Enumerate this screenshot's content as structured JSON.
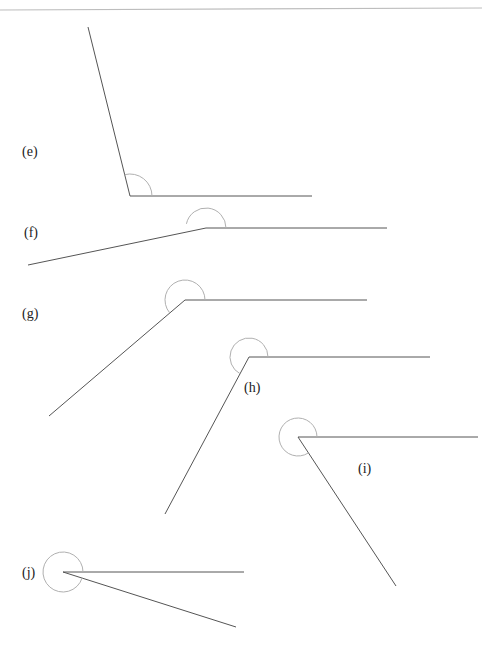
{
  "figure": {
    "type": "angle-diagrams",
    "panels": [
      {
        "label": "(e)",
        "label_pos": [
          22,
          152
        ],
        "vertex": [
          130,
          196
        ],
        "ray1_end": [
          88,
          27
        ],
        "ray2_end": [
          312,
          196
        ],
        "arc": {
          "r": 22,
          "start_deg": 0,
          "end_deg": 104
        }
      },
      {
        "label": "(f)",
        "label_pos": [
          24,
          224
        ],
        "vertex": [
          206,
          228
        ],
        "ray1_end": [
          28,
          265
        ],
        "ray2_end": [
          387,
          228
        ],
        "arc": {
          "r": 20,
          "start_deg": 0,
          "end_deg": 168
        }
      },
      {
        "label": "(g)",
        "label_pos": [
          22,
          305
        ],
        "vertex": [
          185,
          300
        ],
        "ray1_end": [
          49,
          416
        ],
        "ray2_end": [
          367,
          300
        ],
        "arc": {
          "r": 20,
          "start_deg": 0,
          "end_deg": 220
        }
      },
      {
        "label": "(h)",
        "label_pos": [
          244,
          378
        ],
        "vertex": [
          249,
          357
        ],
        "ray1_end": [
          165,
          514
        ],
        "ray2_end": [
          430,
          357
        ],
        "arc": {
          "r": 19,
          "start_deg": 0,
          "end_deg": 242
        }
      },
      {
        "label": "(i)",
        "label_pos": [
          358,
          460
        ],
        "vertex": [
          298,
          437
        ],
        "ray1_end": [
          396,
          586
        ],
        "ray2_end": [
          478,
          437
        ],
        "arc": {
          "r": 19,
          "start_deg": 0,
          "end_deg": 303
        }
      },
      {
        "label": "(j)",
        "label_pos": [
          22,
          566
        ],
        "vertex": [
          63,
          572
        ],
        "ray1_end": [
          236,
          627
        ],
        "ray2_end": [
          244,
          572
        ],
        "arc": {
          "r": 20,
          "start_deg": 0,
          "end_deg": 343
        }
      }
    ]
  }
}
